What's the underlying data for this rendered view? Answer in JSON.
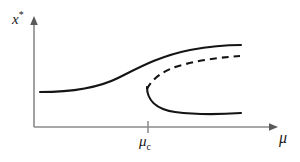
{
  "figure": {
    "name": "saddle-node-hysteresis-bifurcation-diagram",
    "background_color": "#ffffff",
    "curve_color": "#141414",
    "axis_color": "#8a8a8a"
  },
  "axes": {
    "y_label": "x",
    "y_label_superscript": "*",
    "x_label": "μ",
    "x_tick_label": "μ",
    "x_tick_subscript": "c"
  },
  "chart_data": {
    "type": "line",
    "title": "",
    "xlabel": "μ",
    "ylabel": "x*",
    "xlim": [
      0,
      1
    ],
    "ylim": [
      0,
      1
    ],
    "grid": false,
    "legend": null,
    "annotations": [
      {
        "text": "μ_c",
        "role": "x-axis-tick",
        "x_pixel": 148
      }
    ],
    "axis_arrows": {
      "x": "right",
      "y": "up"
    },
    "x_ticks": [
      {
        "label": "μ_c",
        "x_pixel": 148
      }
    ],
    "y_ticks": [],
    "series": [
      {
        "name": "upper-stable-branch",
        "style": "solid",
        "path": "M 40 92 C 70 92, 96 89, 118 78 C 140 67, 160 56, 190 50 C 212 46, 230 45, 241 45",
        "points": [
          [
            40,
            92
          ],
          [
            70,
            91
          ],
          [
            100,
            86
          ],
          [
            120,
            77
          ],
          [
            148,
            66
          ],
          [
            175,
            55
          ],
          [
            205,
            48
          ],
          [
            241,
            45
          ]
        ]
      },
      {
        "name": "unstable-branch",
        "style": "dashed",
        "path": "M 147 89 C 152 79, 163 70, 182 65 C 203 59, 226 57, 240 56",
        "points": [
          [
            147,
            89
          ],
          [
            155,
            77
          ],
          [
            170,
            69
          ],
          [
            190,
            63
          ],
          [
            215,
            59
          ],
          [
            240,
            56
          ]
        ]
      },
      {
        "name": "lower-stable-branch",
        "style": "solid",
        "path": "M 147 87 C 147 99, 155 109, 175 112 C 198 115, 226 114, 241 113",
        "points": [
          [
            147,
            87
          ],
          [
            150,
            100
          ],
          [
            162,
            109
          ],
          [
            185,
            113
          ],
          [
            212,
            114
          ],
          [
            241,
            113
          ]
        ]
      }
    ],
    "fold_point": {
      "x_pixel": 147,
      "y_pixel": 88,
      "label": "μ_c"
    }
  }
}
